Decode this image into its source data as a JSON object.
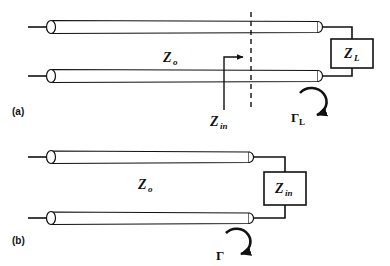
{
  "figure": {
    "width": 390,
    "height": 266,
    "background": "#ffffff",
    "ink": "#111111"
  },
  "panels": [
    {
      "id": "a",
      "label": "(a)",
      "description": "Two-conductor transmission line of characteristic impedance Z_o terminated in load impedance Z_L, with a reference plane showing input impedance Z_in and reflection coefficient Gamma_L at the load",
      "labels": {
        "characteristic_impedance": {
          "symbol": "Z",
          "subscript": "o",
          "text": "Zo"
        },
        "input_impedance": {
          "symbol": "Z",
          "subscript": "in",
          "text": "Zin"
        },
        "load_impedance": {
          "symbol": "Z",
          "subscript": "L",
          "text": "ZL"
        },
        "reflection_coefficient": {
          "symbol": "Γ",
          "subscript": "L",
          "text": "ΓL"
        }
      }
    },
    {
      "id": "b",
      "label": "(b)",
      "description": "Equivalent circuit: shortened transmission line of characteristic impedance Z_o terminated in the input impedance Z_in, with reflection coefficient Gamma",
      "labels": {
        "characteristic_impedance": {
          "symbol": "Z",
          "subscript": "o",
          "text": "Zo"
        },
        "input_impedance": {
          "symbol": "Z",
          "subscript": "in",
          "text": "Zin"
        },
        "reflection_coefficient": {
          "symbol": "Γ",
          "subscript": "",
          "text": "Γ"
        }
      }
    }
  ],
  "elements": {
    "dashed_reference_plane": "reference-plane",
    "arrow_to_plane": "z-in-pointer",
    "curved_arrow_a": "gamma-l-curved-arrow",
    "curved_arrow_b": "gamma-curved-arrow"
  }
}
